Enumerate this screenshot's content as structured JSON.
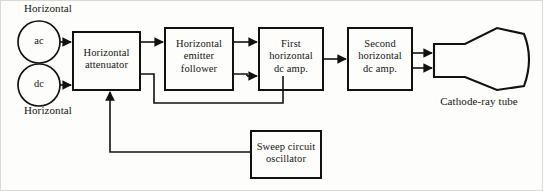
{
  "figure": {
    "background_color": "#fdfdfb",
    "line_color": "#111111",
    "frame_color": "#cfcfcf"
  },
  "inputs": {
    "top_caption": "Horizontal",
    "bottom_caption": "Horizontal",
    "nodes": [
      {
        "id": "ac",
        "label": "ac"
      },
      {
        "id": "dc",
        "label": "dc"
      }
    ]
  },
  "blocks": [
    {
      "id": "horizontal-attenuator",
      "label": "Horizontal\nattenuator"
    },
    {
      "id": "horizontal-emitter-follower",
      "label": "Horizontal\nemitter\nfollower"
    },
    {
      "id": "first-horizontal-dc-amp",
      "label": "First\nhorizontal\ndc amp."
    },
    {
      "id": "second-horizontal-dc-amp",
      "label": "Second\nhorizontal\ndc amp."
    },
    {
      "id": "sweep-circuit-oscillator",
      "label": "Sweep circuit\noscillator"
    }
  ],
  "crt": {
    "id": "cathode-ray-tube",
    "caption": "Cathode-ray tube"
  },
  "connections": [
    {
      "from": "ac",
      "to": "horizontal-attenuator"
    },
    {
      "from": "dc",
      "to": "horizontal-attenuator"
    },
    {
      "from": "horizontal-attenuator",
      "to": "horizontal-emitter-follower"
    },
    {
      "from": "horizontal-attenuator",
      "to": "first-horizontal-dc-amp"
    },
    {
      "from": "horizontal-emitter-follower",
      "to": "first-horizontal-dc-amp"
    },
    {
      "from": "first-horizontal-dc-amp",
      "to": "second-horizontal-dc-amp"
    },
    {
      "from": "second-horizontal-dc-amp",
      "to": "cathode-ray-tube"
    },
    {
      "from": "sweep-circuit-oscillator",
      "to": "horizontal-attenuator"
    }
  ]
}
